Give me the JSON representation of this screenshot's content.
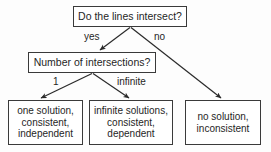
{
  "diagram": {
    "title_text": "Linear system solution decision tree",
    "background_color": "#fdfdfd",
    "border_color": "#3a3a3a",
    "text_color": "#1f1f1f",
    "nodes": {
      "root_question": {
        "lines": [
          "Do the lines intersect?"
        ]
      },
      "intersections_question": {
        "lines": [
          "Number of intersections?"
        ]
      },
      "one_solution": {
        "lines": [
          "one solution,",
          "consistent,",
          "independent"
        ]
      },
      "infinite_solutions": {
        "lines": [
          "infinite solutions,",
          "consistent,",
          "dependent"
        ]
      },
      "no_solution": {
        "lines": [
          "no solution,",
          "inconsistent"
        ]
      }
    },
    "edge_labels": {
      "yes": "yes",
      "no": "no",
      "one": "1",
      "infinite": "infinite"
    }
  }
}
